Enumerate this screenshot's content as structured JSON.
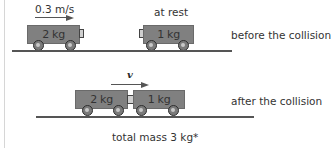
{
  "before": {
    "velocity_label": "0.3 m/s",
    "rest_label": "at rest",
    "caption": "before the collision",
    "cart_a": {
      "mass_label": "2 kg"
    },
    "cart_b": {
      "mass_label": "1 kg"
    }
  },
  "after": {
    "velocity_label": "v",
    "caption": "after the collision",
    "cart_a": {
      "mass_label": "2 kg"
    },
    "cart_b": {
      "mass_label": "1 kg"
    },
    "total_mass_label": "total mass 3 kg*"
  },
  "colors": {
    "cart": "#808080",
    "ground": "#555555",
    "text": "#333333"
  }
}
